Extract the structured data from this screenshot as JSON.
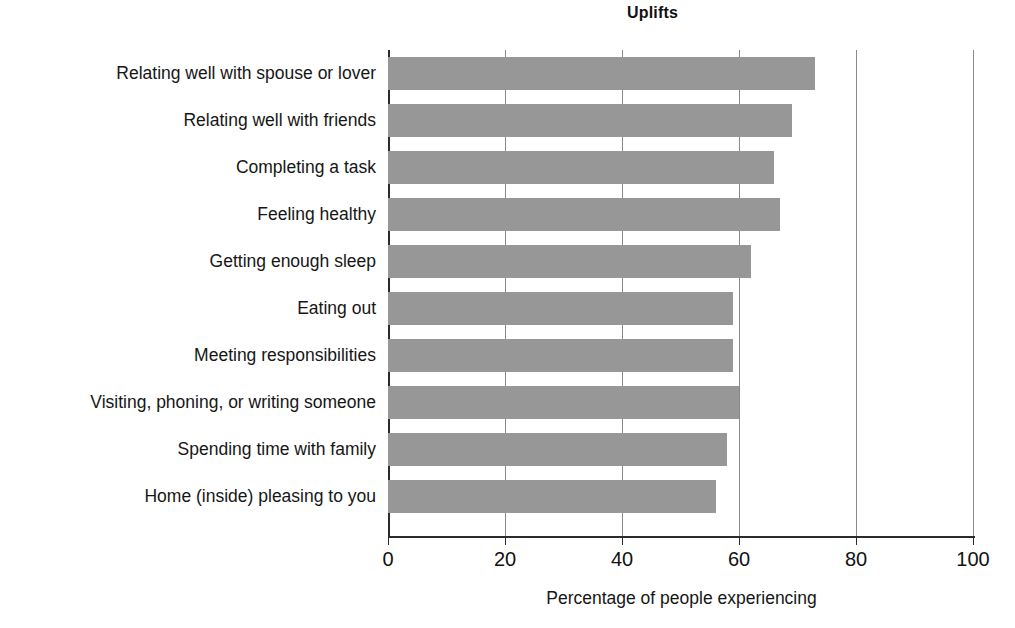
{
  "chart_data": {
    "type": "bar",
    "orientation": "horizontal",
    "title": "Uplifts",
    "xlabel": "Percentage of people experiencing",
    "ylabel": "",
    "xlim": [
      0,
      100
    ],
    "xticks": [
      0,
      20,
      40,
      60,
      80,
      100
    ],
    "xtick_labels": [
      "0",
      "20",
      "40",
      "60",
      "80",
      "100"
    ],
    "grid": "vertical",
    "legend": "none",
    "bar_color": "#979797",
    "axis_color": "#2b2b2b",
    "gridline_color": "#8a8a8a",
    "categories": [
      "Relating well with spouse or lover",
      "Relating well with friends",
      "Completing a task",
      "Feeling healthy",
      "Getting enough sleep",
      "Eating out",
      "Meeting responsibilities",
      "Visiting, phoning, or writing someone",
      "Spending time with family",
      "Home (inside) pleasing to you"
    ],
    "values": [
      73,
      69,
      66,
      67,
      62,
      59,
      59,
      60,
      58,
      56
    ]
  },
  "axis": {
    "x_title": "Percentage of people experiencing"
  }
}
